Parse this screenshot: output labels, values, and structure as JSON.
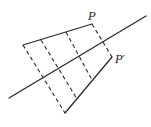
{
  "diagram": {
    "type": "reflection-across-line",
    "labels": {
      "point": "P",
      "image_point": "P′"
    },
    "mirror_line": {
      "x1": 9,
      "y1": 98,
      "x2": 146,
      "y2": 16
    },
    "original_edge": {
      "x1": 23,
      "y1": 45,
      "x2": 92,
      "y2": 24
    },
    "reflected_edge": {
      "x1": 65,
      "y1": 113,
      "x2": 112,
      "y2": 57
    },
    "perpendiculars": [
      {
        "x1": 23,
        "y1": 45,
        "x2": 65,
        "y2": 113
      },
      {
        "x1": 41,
        "y1": 40,
        "x2": 77,
        "y2": 99
      },
      {
        "x1": 66,
        "y1": 32,
        "x2": 92,
        "y2": 80
      },
      {
        "x1": 92,
        "y1": 24,
        "x2": 112,
        "y2": 57
      }
    ],
    "label_positions": {
      "point": {
        "x": 88,
        "y": 20
      },
      "image_point": {
        "x": 115,
        "y": 63
      }
    },
    "stroke_color": "#2a2a2a"
  }
}
